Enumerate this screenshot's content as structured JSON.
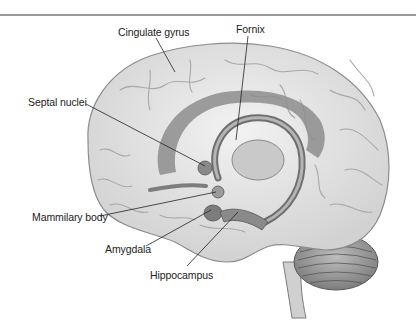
{
  "figure": {
    "type": "anatomical-diagram",
    "labels": [
      {
        "id": "cingulate-gyrus",
        "text": "Cingulate gyrus",
        "x": 118,
        "y": 25
      },
      {
        "id": "fornix",
        "text": "Fornix",
        "x": 236,
        "y": 22
      },
      {
        "id": "septal-nuclei",
        "text": "Septal nuclei",
        "x": 28,
        "y": 96
      },
      {
        "id": "mammilary-body",
        "text": "Mammilary body",
        "x": 32,
        "y": 211
      },
      {
        "id": "amygdala",
        "text": "Amygdala",
        "x": 105,
        "y": 242
      },
      {
        "id": "hippocampus",
        "text": "Hippocampus",
        "x": 150,
        "y": 268
      }
    ],
    "colors": {
      "brain_fill": "#e6e6e6",
      "brain_stroke": "#8c8c8c",
      "limbic_fill": "#8a8a8a",
      "limbic_light": "#b3b3b3",
      "leader_line": "#222222",
      "rule": "#9a9a9a"
    }
  }
}
